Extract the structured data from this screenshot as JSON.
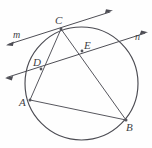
{
  "figure": {
    "kind": "circle-geometry-diagram",
    "canvas": {
      "width": 152,
      "height": 148,
      "background": "#fefefe"
    },
    "stroke_color": "#4b4b52",
    "label_color": "#3e3e44",
    "circle": {
      "cx": 81.5,
      "cy": 83.5,
      "r": 56.5
    },
    "points": [
      {
        "id": "C",
        "label": "C",
        "x": 61,
        "y": 29
      },
      {
        "id": "D",
        "label": "D",
        "x": 41,
        "y": 69
      },
      {
        "id": "E",
        "label": "E",
        "x": 82,
        "y": 51
      },
      {
        "id": "A",
        "label": "A",
        "x": 30,
        "y": 100
      },
      {
        "id": "B",
        "label": "B",
        "x": 126,
        "y": 120
      }
    ],
    "segments": [
      {
        "id": "CA",
        "from": "C",
        "to": "A"
      },
      {
        "id": "CB",
        "from": "C",
        "to": "B"
      },
      {
        "id": "AB",
        "from": "A",
        "to": "B"
      }
    ],
    "lines": [
      {
        "id": "m",
        "label": "m",
        "through": [
          "C"
        ],
        "arrows": "both",
        "x1": 6,
        "y1": 45,
        "x2": 113,
        "y2": 11
      },
      {
        "id": "n",
        "label": "n",
        "through": [
          "D",
          "E"
        ],
        "arrows": "both",
        "x1": 5,
        "y1": 78,
        "x2": 148,
        "y2": 32
      }
    ],
    "labels": {
      "C": "C",
      "D": "D",
      "E": "E",
      "A": "A",
      "B": "B",
      "m": "m",
      "n": "n"
    }
  }
}
